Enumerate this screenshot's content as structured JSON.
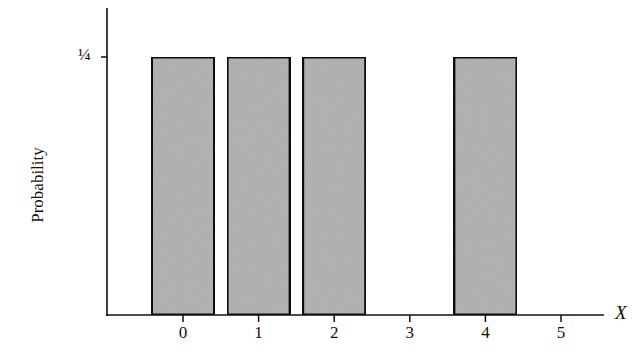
{
  "chart_data": {
    "type": "bar",
    "title": "",
    "xlabel": "X",
    "ylabel": "Probability",
    "categories": [
      "0",
      "1",
      "2",
      "3",
      "4",
      "5"
    ],
    "values": [
      0.25,
      0.25,
      0.25,
      0,
      0.25,
      0
    ],
    "x": [
      0,
      1,
      2,
      3,
      4,
      5
    ],
    "yticks": [
      {
        "value": 0.25,
        "label": "¼"
      }
    ],
    "xticks": [
      "0",
      "1",
      "2",
      "3",
      "4",
      "5"
    ],
    "ylim": [
      0,
      0.3
    ],
    "xlim": [
      -1,
      5.6
    ],
    "grid": false,
    "legend": null,
    "bar_fill": "#b4b4b4",
    "bar_edge": "#111111"
  },
  "axes": {
    "ylabel": "Probability",
    "xlabel": "X",
    "ytick_label": "¼",
    "xtick_labels": [
      "0",
      "1",
      "2",
      "3",
      "4",
      "5"
    ]
  }
}
